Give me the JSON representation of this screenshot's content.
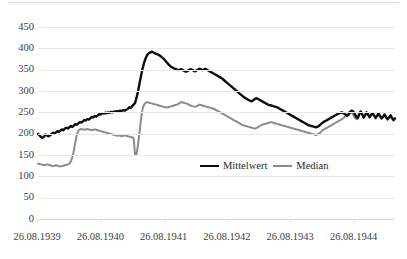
{
  "chart_data": {
    "type": "line",
    "title": "",
    "subtitle": "",
    "xlabel": "",
    "ylabel": "",
    "ylim": [
      0,
      450
    ],
    "y_ticks": [
      0,
      50,
      100,
      150,
      200,
      250,
      300,
      350,
      400,
      450
    ],
    "x_tick_labels": [
      "26.08.1939",
      "26.08.1940",
      "26.08.1941",
      "26.08.1942",
      "26.08.1943",
      "26.08.1944"
    ],
    "x_range": [
      "26.08.1939",
      "26.02.1945"
    ],
    "grid": "horizontal",
    "legend_position": "inside-bottom-center",
    "colors": {
      "mean": "#0d0d0d",
      "median": "#8c8c8c",
      "grid": "#e8e8e8",
      "text": "#404040"
    },
    "series": [
      {
        "name": "Mittelwert",
        "color": "#0d0d0d",
        "values": [
          200,
          196,
          192,
          190,
          193,
          198,
          196,
          194,
          196,
          199,
          202,
          200,
          203,
          206,
          204,
          207,
          210,
          208,
          212,
          214,
          212,
          215,
          218,
          216,
          219,
          222,
          221,
          224,
          227,
          226,
          229,
          232,
          231,
          234,
          233,
          236,
          239,
          238,
          241,
          240,
          243,
          246,
          245,
          248,
          247,
          249,
          248,
          250,
          249,
          251,
          250,
          252,
          251,
          253,
          252,
          254,
          253,
          255,
          254,
          256,
          258,
          262,
          260,
          264,
          268,
          272,
          285,
          300,
          318,
          336,
          352,
          366,
          376,
          384,
          388,
          390,
          392,
          391,
          389,
          387,
          386,
          384,
          382,
          379,
          376,
          372,
          368,
          364,
          360,
          357,
          355,
          353,
          352,
          350,
          349,
          350,
          351,
          349,
          347,
          345,
          347,
          349,
          351,
          350,
          348,
          346,
          348,
          350,
          352,
          351,
          349,
          350,
          352,
          350,
          348,
          346,
          344,
          342,
          340,
          338,
          336,
          334,
          332,
          330,
          327,
          324,
          321,
          318,
          315,
          312,
          309,
          306,
          303,
          300,
          297,
          294,
          291,
          288,
          285,
          283,
          281,
          279,
          277,
          276,
          278,
          281,
          283,
          282,
          280,
          278,
          276,
          274,
          272,
          270,
          268,
          267,
          266,
          265,
          264,
          263,
          262,
          260,
          258,
          256,
          254,
          252,
          250,
          248,
          246,
          244,
          242,
          240,
          238,
          236,
          234,
          232,
          230,
          228,
          226,
          224,
          222,
          220,
          219,
          218,
          217,
          216,
          215,
          216,
          218,
          221,
          224,
          227,
          229,
          231,
          233,
          235,
          237,
          239,
          241,
          243,
          245,
          247,
          248,
          250,
          249,
          247,
          244,
          242,
          245,
          250,
          254,
          252,
          247,
          240,
          236,
          244,
          252,
          246,
          238,
          243,
          250,
          245,
          239,
          244,
          248,
          243,
          237,
          242,
          247,
          241,
          236,
          240,
          245,
          239,
          234,
          238,
          243,
          237,
          232,
          236
        ]
      },
      {
        "name": "Median",
        "color": "#8c8c8c",
        "values": [
          130,
          129,
          128,
          127,
          126,
          127,
          128,
          127,
          126,
          125,
          124,
          125,
          126,
          125,
          124,
          123,
          124,
          125,
          126,
          127,
          128,
          130,
          135,
          145,
          160,
          180,
          198,
          207,
          210,
          211,
          210,
          209,
          210,
          211,
          210,
          209,
          208,
          209,
          210,
          209,
          208,
          207,
          206,
          205,
          204,
          203,
          202,
          201,
          200,
          199,
          198,
          197,
          196,
          195,
          196,
          195,
          194,
          195,
          196,
          195,
          194,
          193,
          192,
          191,
          190,
          150,
          152,
          175,
          205,
          235,
          258,
          268,
          272,
          274,
          273,
          272,
          271,
          270,
          269,
          268,
          267,
          266,
          265,
          264,
          263,
          262,
          261,
          262,
          263,
          264,
          265,
          266,
          267,
          268,
          270,
          272,
          274,
          273,
          272,
          271,
          270,
          268,
          266,
          265,
          264,
          263,
          264,
          266,
          268,
          267,
          266,
          265,
          264,
          263,
          262,
          261,
          260,
          259,
          258,
          256,
          254,
          252,
          250,
          248,
          246,
          244,
          242,
          240,
          238,
          236,
          234,
          232,
          230,
          228,
          226,
          224,
          222,
          220,
          219,
          218,
          217,
          216,
          215,
          214,
          213,
          212,
          213,
          215,
          217,
          219,
          221,
          222,
          223,
          224,
          225,
          226,
          227,
          226,
          225,
          224,
          223,
          222,
          221,
          220,
          219,
          218,
          217,
          216,
          215,
          214,
          213,
          212,
          211,
          210,
          209,
          208,
          207,
          206,
          205,
          204,
          203,
          202,
          201,
          200,
          199,
          198,
          197,
          198,
          200,
          203,
          206,
          209,
          211,
          213,
          215,
          217,
          219,
          221,
          223,
          225,
          227,
          229,
          231,
          233,
          235,
          238,
          242,
          246,
          250,
          253,
          250,
          244,
          238,
          234,
          240,
          248,
          252,
          246,
          238,
          242,
          248,
          244,
          238,
          243,
          247,
          242,
          236,
          241,
          246,
          240,
          235,
          239,
          244,
          238,
          233,
          237,
          242,
          236,
          231,
          235
        ]
      }
    ]
  },
  "axis": {
    "y_labels": [
      "450",
      "400",
      "350",
      "300",
      "250",
      "200",
      "150",
      "100",
      "50",
      "0"
    ],
    "x_labels": [
      "26.08.1939",
      "26.08.1940",
      "26.08.1941",
      "26.08.1942",
      "26.08.1943",
      "26.08.1944"
    ]
  },
  "legend": {
    "items": [
      {
        "label": "Mittelwert",
        "color": "#0d0d0d"
      },
      {
        "label": "Median",
        "color": "#8c8c8c"
      }
    ]
  }
}
